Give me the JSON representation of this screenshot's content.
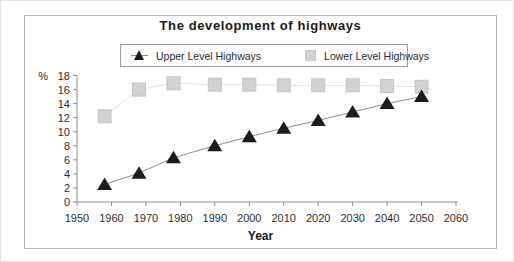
{
  "chart_data": {
    "type": "line",
    "title": "The development of highways",
    "xlabel": "Year",
    "ylabel": "%",
    "x_ticks": [
      1950,
      1960,
      1970,
      1980,
      1990,
      2000,
      2010,
      2020,
      2030,
      2040,
      2050,
      2060
    ],
    "xlim": [
      1950,
      2060
    ],
    "ylim": [
      0,
      18
    ],
    "y_tick_step": 2,
    "grid": false,
    "legend_position": "top-center-boxed",
    "series": [
      {
        "name": "Upper Level Highways",
        "marker": "triangle",
        "marker_color": "#1c1c1c",
        "line_color": "#8c8c8c",
        "x": [
          1958,
          1968,
          1978,
          1990,
          2000,
          2010,
          2020,
          2030,
          2040,
          2050
        ],
        "values": [
          2.5,
          4.1,
          6.3,
          8,
          9.3,
          10.5,
          11.6,
          12.8,
          14,
          15
        ]
      },
      {
        "name": "Lower Level Highways",
        "marker": "square",
        "marker_color": "#d2d2d2",
        "line_color": "#e2e2e2",
        "x": [
          1958,
          1968,
          1978,
          1990,
          2000,
          2010,
          2020,
          2030,
          2040,
          2050
        ],
        "values": [
          12.2,
          16,
          16.9,
          16.7,
          16.7,
          16.6,
          16.6,
          16.6,
          16.5,
          16.4
        ]
      }
    ],
    "axis_color": "#8c8c8c",
    "text_color": "#2e2e2e"
  }
}
